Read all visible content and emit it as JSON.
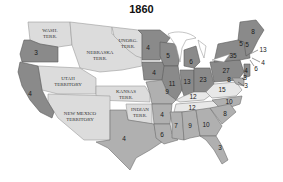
{
  "title": "1860",
  "colors": {
    "territory": "#dcdcdc",
    "free_state": "#8a8a8a",
    "slave_state": "#b0b0b0",
    "border_state": "#e8e8e8"
  },
  "territories": [
    {
      "name": "WASH.",
      "line2": "TERR."
    },
    {
      "name": "NEBRASKA",
      "line2": "TERR."
    },
    {
      "name": "UNORG.",
      "line2": "TERR."
    },
    {
      "name": "UTAH",
      "line2": "TERRITORY"
    },
    {
      "name": "KANSAS",
      "line2": "TERR."
    },
    {
      "name": "NEW MEXICO",
      "line2": "TERRITORY"
    },
    {
      "name": "INDIAN",
      "line2": "TERR."
    }
  ],
  "electoral_votes": {
    "oregon": "3",
    "california": "4",
    "minnesota": "4",
    "iowa": "4",
    "wisconsin": "5",
    "michigan": "6",
    "illinois": "11",
    "indiana": "13",
    "ohio": "23",
    "pennsylvania": "27",
    "new_york": "35",
    "maine": "8",
    "vermont": "5",
    "new_hampshire": "5",
    "massachusetts": "13",
    "rhode_island": "4",
    "connecticut": "6",
    "new_jersey": "4",
    "delaware": "3",
    "maryland": "8",
    "dc_area": "3",
    "missouri": "9",
    "kentucky": "12",
    "virginia": "15",
    "tennessee": "12",
    "north_carolina": "10",
    "south_carolina": "8",
    "arkansas": "4",
    "texas": "4",
    "louisiana": "6",
    "mississippi": "7",
    "alabama": "9",
    "georgia": "10",
    "florida": "3"
  }
}
